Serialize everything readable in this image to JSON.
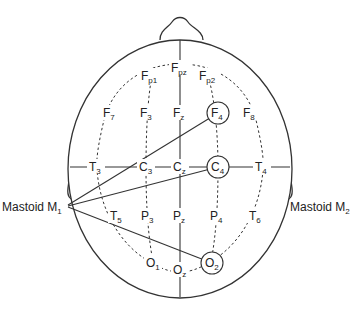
{
  "diagram": {
    "electrodes": [
      {
        "id": "Fpz",
        "base": "F",
        "sub": "pz",
        "circled": false
      },
      {
        "id": "Fp1",
        "base": "F",
        "sub": "p1",
        "circled": false
      },
      {
        "id": "Fp2",
        "base": "F",
        "sub": "p2",
        "circled": false
      },
      {
        "id": "F7",
        "base": "F",
        "sub": "7",
        "circled": false
      },
      {
        "id": "F3",
        "base": "F",
        "sub": "3",
        "circled": false
      },
      {
        "id": "Fz",
        "base": "F",
        "sub": "z",
        "circled": false
      },
      {
        "id": "F4",
        "base": "F",
        "sub": "4",
        "circled": true
      },
      {
        "id": "F8",
        "base": "F",
        "sub": "8",
        "circled": false
      },
      {
        "id": "T3",
        "base": "T",
        "sub": "3",
        "circled": false
      },
      {
        "id": "C3",
        "base": "C",
        "sub": "3",
        "circled": false
      },
      {
        "id": "Cz",
        "base": "C",
        "sub": "z",
        "circled": false
      },
      {
        "id": "C4",
        "base": "C",
        "sub": "4",
        "circled": true
      },
      {
        "id": "T4",
        "base": "T",
        "sub": "4",
        "circled": false
      },
      {
        "id": "T5",
        "base": "T",
        "sub": "5",
        "circled": false
      },
      {
        "id": "P3",
        "base": "P",
        "sub": "3",
        "circled": false
      },
      {
        "id": "Pz",
        "base": "P",
        "sub": "z",
        "circled": false
      },
      {
        "id": "P4",
        "base": "P",
        "sub": "4",
        "circled": false
      },
      {
        "id": "T6",
        "base": "T",
        "sub": "6",
        "circled": false
      },
      {
        "id": "O1",
        "base": "O",
        "sub": "1",
        "circled": false
      },
      {
        "id": "Oz",
        "base": "O",
        "sub": "z",
        "circled": false
      },
      {
        "id": "O2",
        "base": "O",
        "sub": "2",
        "circled": true
      }
    ],
    "mastoids": [
      {
        "id": "M1",
        "base": "Mastoid M",
        "sub": "1"
      },
      {
        "id": "M2",
        "base": "Mastoid M",
        "sub": "2"
      }
    ],
    "connections": [
      {
        "from": "M1",
        "to": "F4"
      },
      {
        "from": "M1",
        "to": "C4"
      },
      {
        "from": "M1",
        "to": "O2"
      }
    ]
  }
}
